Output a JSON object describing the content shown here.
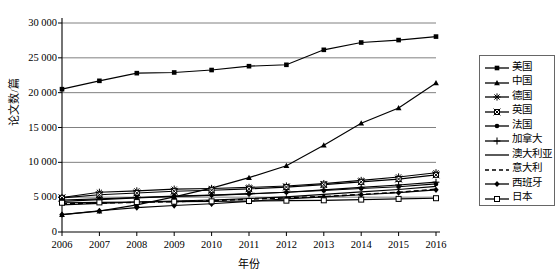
{
  "chart_data": {
    "type": "line",
    "title": "",
    "xlabel": "年份",
    "ylabel": "论文数/篇",
    "categories": [
      "2006",
      "2007",
      "2008",
      "2009",
      "2010",
      "2011",
      "2012",
      "2013",
      "2014",
      "2015",
      "2016"
    ],
    "x": [
      2006,
      2007,
      2008,
      2009,
      2010,
      2011,
      2012,
      2013,
      2014,
      2015,
      2016
    ],
    "ylim": [
      0,
      30000
    ],
    "yticks": [
      "0",
      "5 000",
      "10 000",
      "15 000",
      "20 000",
      "25 000",
      "30 000"
    ],
    "ytick_values": [
      0,
      5000,
      10000,
      15000,
      20000,
      25000,
      30000
    ],
    "grid": true,
    "legend_position": "right",
    "series": [
      {
        "name": "美国",
        "marker": "square-filled",
        "dash": "solid",
        "values": [
          20500,
          21700,
          22800,
          22900,
          23250,
          23800,
          24000,
          26150,
          27200,
          27550,
          28050
        ]
      },
      {
        "name": "中国",
        "marker": "triangle-filled",
        "dash": "solid",
        "values": [
          2500,
          3000,
          3900,
          5050,
          6300,
          7800,
          9500,
          12450,
          15600,
          17800,
          21400
        ]
      },
      {
        "name": "德国",
        "marker": "star",
        "dash": "solid",
        "values": [
          4950,
          5700,
          5900,
          6150,
          6250,
          6400,
          6600,
          6950,
          7400,
          7900,
          8500
        ]
      },
      {
        "name": "英国",
        "marker": "square-crossed",
        "dash": "solid",
        "values": [
          4900,
          5350,
          5600,
          5850,
          6000,
          6200,
          6450,
          6800,
          7200,
          7600,
          8200
        ]
      },
      {
        "name": "法国",
        "marker": "circle-filled",
        "dash": "solid",
        "values": [
          4600,
          4750,
          4950,
          5150,
          5300,
          5500,
          5700,
          5950,
          6250,
          6500,
          6900
        ]
      },
      {
        "name": "加拿大",
        "marker": "plus",
        "dash": "solid",
        "values": [
          4400,
          4650,
          4900,
          5100,
          5250,
          5450,
          5700,
          6050,
          6400,
          6750,
          7150
        ]
      },
      {
        "name": "澳大利亚",
        "marker": "none",
        "dash": "solid",
        "values": [
          3900,
          4100,
          4300,
          4450,
          4600,
          4800,
          5050,
          5400,
          5750,
          6100,
          6550
        ]
      },
      {
        "name": "意大利",
        "marker": "none",
        "dash": "dashed",
        "values": [
          4050,
          4150,
          4250,
          4350,
          4500,
          4700,
          4900,
          5100,
          5400,
          5700,
          6150
        ]
      },
      {
        "name": "西班牙",
        "marker": "diamond-filled",
        "dash": "solid",
        "values": [
          2500,
          3050,
          3500,
          3800,
          4050,
          4400,
          4750,
          5050,
          5350,
          5650,
          6050
        ]
      },
      {
        "name": "日本",
        "marker": "square-open",
        "dash": "solid",
        "values": [
          4200,
          4250,
          4300,
          4350,
          4400,
          4450,
          4500,
          4550,
          4650,
          4750,
          4850
        ]
      }
    ]
  }
}
